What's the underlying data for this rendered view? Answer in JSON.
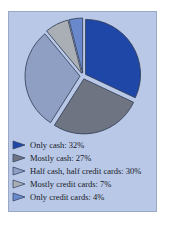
{
  "chart_data": {
    "type": "pie",
    "title": "",
    "categories": [
      "Only cash",
      "Mostly cash",
      "Half cash, half credit cards",
      "Mostly credit cards",
      "Only credit cards"
    ],
    "values": [
      32,
      27,
      30,
      7,
      4
    ],
    "unit": "%",
    "colors": [
      "#1f47a8",
      "#6e7482",
      "#8f9fc4",
      "#a9afb4",
      "#6a88cc"
    ],
    "exploded": true,
    "start_angle_deg": 0,
    "direction": "clockwise",
    "legend_position": "bottom"
  },
  "legend": {
    "items": [
      {
        "label": "Only cash:  32%"
      },
      {
        "label": "Mostly cash:  27%"
      },
      {
        "label": "Half cash, half credit cards:  30%"
      },
      {
        "label": "Mostly credit cards:  7%"
      },
      {
        "label": "Only credit cards:  4%"
      }
    ]
  }
}
